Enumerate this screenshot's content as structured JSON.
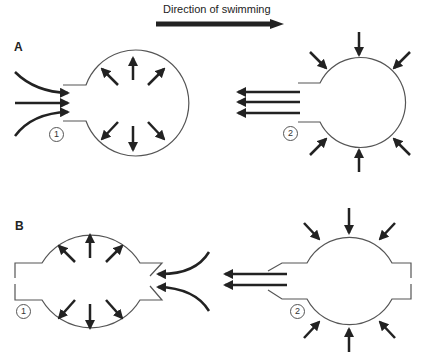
{
  "title": "Direction of swimming",
  "panels": [
    {
      "label": "A",
      "phases": [
        {
          "label": "1",
          "description": "chamber expands, water drawn in through rear opening, outward arrows"
        },
        {
          "label": "2",
          "description": "chamber contracts, water jetted out rearward, inward arrows"
        }
      ]
    },
    {
      "label": "B",
      "phases": [
        {
          "label": "1",
          "description": "chamber expands, water drawn in through front valved opening"
        },
        {
          "label": "2",
          "description": "chamber contracts, water jetted out rearward"
        }
      ]
    }
  ],
  "colors": {
    "line": "#555555",
    "arrow": "#222222",
    "background": "#ffffff"
  }
}
